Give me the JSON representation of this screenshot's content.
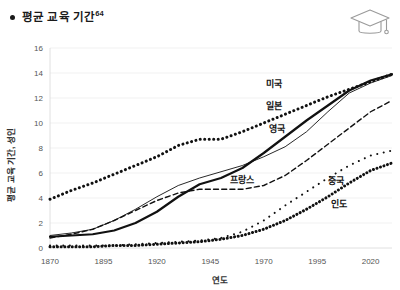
{
  "header": {
    "bullet": "bullet-dot",
    "title": "평균 교육 기간",
    "title_superscript": "64",
    "icon_name": "graduation-cap-icon"
  },
  "chart_data": {
    "type": "line",
    "title": "평균 교육 기간",
    "xlabel": "연도",
    "ylabel": "평균 교육 기간, 성인",
    "xlim": [
      1870,
      2030
    ],
    "ylim": [
      0,
      16
    ],
    "grid": true,
    "legend": "inline-labels",
    "xticks": [
      1870,
      1895,
      1920,
      1945,
      1970,
      1995,
      2020
    ],
    "yticks": [
      0,
      2,
      4,
      6,
      8,
      10,
      12,
      14,
      16
    ],
    "x": [
      1870,
      1880,
      1890,
      1900,
      1910,
      1920,
      1930,
      1940,
      1950,
      1960,
      1970,
      1980,
      1990,
      2000,
      2010,
      2020,
      2030
    ],
    "series": [
      {
        "name": "미국",
        "style": "thick-dotted",
        "label_x": 1975,
        "label_y": 12.9,
        "values": [
          3.9,
          4.6,
          5.2,
          5.9,
          6.6,
          7.3,
          8.2,
          8.7,
          8.7,
          9.3,
          10.0,
          10.7,
          11.4,
          12.1,
          12.7,
          13.3,
          13.9
        ]
      },
      {
        "name": "일본",
        "style": "thick-solid",
        "label_x": 1975,
        "label_y": 11.1,
        "values": [
          0.9,
          1.0,
          1.1,
          1.4,
          2.0,
          2.9,
          4.1,
          5.1,
          5.6,
          6.4,
          7.6,
          8.9,
          10.2,
          11.4,
          12.6,
          13.4,
          13.9
        ]
      },
      {
        "name": "영국",
        "style": "thin-solid",
        "label_x": 1976,
        "label_y": 9.3,
        "values": [
          1.0,
          1.2,
          1.5,
          2.2,
          3.1,
          4.1,
          5.0,
          5.6,
          6.1,
          6.6,
          7.3,
          8.1,
          9.3,
          10.9,
          12.4,
          13.2,
          13.8
        ]
      },
      {
        "name": "프랑스",
        "style": "dashed",
        "label_x": 1960,
        "label_y": 5.2,
        "values": [
          0.8,
          1.1,
          1.5,
          2.2,
          3.0,
          3.8,
          4.4,
          4.7,
          4.7,
          4.7,
          5.0,
          5.8,
          7.0,
          8.3,
          9.6,
          10.9,
          11.8
        ]
      },
      {
        "name": "중국",
        "style": "sparse-dotted",
        "label_x": 2004,
        "label_y": 5.1,
        "values": [
          0.2,
          0.2,
          0.2,
          0.2,
          0.3,
          0.4,
          0.5,
          0.6,
          0.8,
          1.3,
          2.2,
          3.4,
          4.5,
          5.6,
          6.6,
          7.4,
          7.8
        ]
      },
      {
        "name": "인도",
        "style": "thick-dotted-low",
        "label_x": 2005,
        "label_y": 3.3,
        "values": [
          0.1,
          0.1,
          0.1,
          0.2,
          0.2,
          0.3,
          0.4,
          0.5,
          0.7,
          1.0,
          1.5,
          2.2,
          3.1,
          4.1,
          5.2,
          6.2,
          6.8
        ]
      }
    ]
  }
}
